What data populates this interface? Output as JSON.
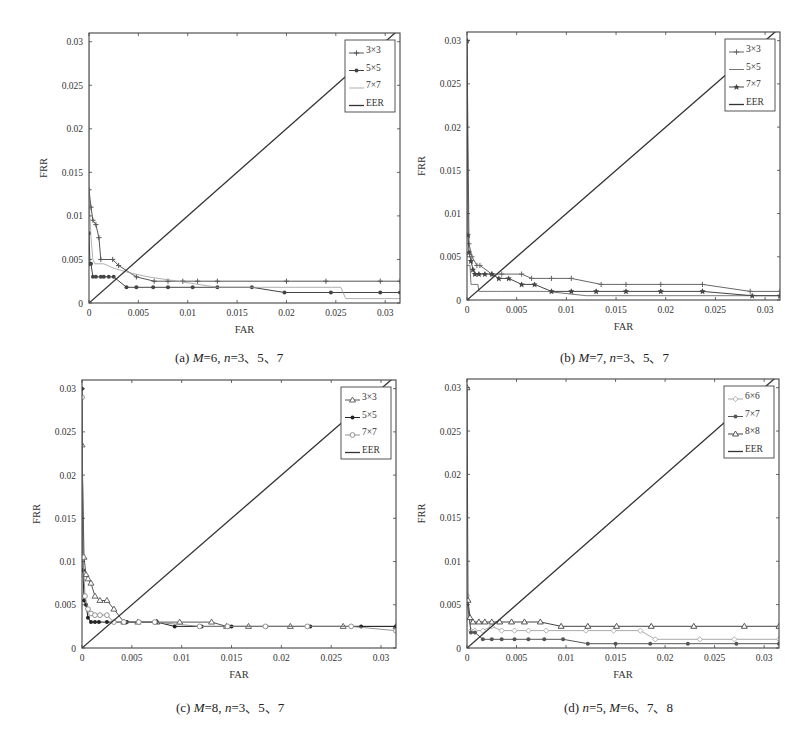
{
  "figure": {
    "captions": [
      {
        "prefix": "(a) ",
        "parts": [
          [
            "M",
            true
          ],
          [
            "=6, ",
            false
          ],
          [
            "n",
            true
          ],
          [
            "=3、5、7",
            false
          ]
        ]
      },
      {
        "prefix": "(b) ",
        "parts": [
          [
            "M",
            true
          ],
          [
            "=7, ",
            false
          ],
          [
            "n",
            true
          ],
          [
            "=3、5、7",
            false
          ]
        ]
      },
      {
        "prefix": "(c) ",
        "parts": [
          [
            "M",
            true
          ],
          [
            "=8, ",
            false
          ],
          [
            "n",
            true
          ],
          [
            "=3、5、7",
            false
          ]
        ]
      },
      {
        "prefix": "(d) ",
        "parts": [
          [
            "n",
            true
          ],
          [
            "=5, ",
            false
          ],
          [
            "M",
            true
          ],
          [
            "=6、7、8",
            false
          ]
        ]
      }
    ]
  },
  "chart_data": [
    {
      "id": "a",
      "type": "line",
      "title": "(a) M=6, n=3、5、7",
      "xlabel": "FAR",
      "ylabel": "FRR",
      "xlim": [
        0,
        0.0315
      ],
      "ylim": [
        0,
        0.031
      ],
      "xticks": [
        0,
        0.005,
        0.01,
        0.015,
        0.02,
        0.025,
        0.03
      ],
      "xtick_labels": [
        "0",
        "0.005",
        "0.01",
        "0.015",
        "0.02",
        "0.025",
        "0.03"
      ],
      "yticks": [
        0,
        0.005,
        0.01,
        0.015,
        0.02,
        0.025,
        0.03
      ],
      "ytick_labels": [
        "0",
        "0.005",
        "0.01",
        "0.015",
        "0.02",
        "0.025",
        "0.03"
      ],
      "grid": false,
      "legend_position": "upper right",
      "series": [
        {
          "name": "3×3",
          "marker": "plus",
          "color": "#555555",
          "width": 1,
          "x": [
            0.0,
            0.0002,
            0.0004,
            0.0007,
            0.001,
            0.0012,
            0.0024,
            0.003,
            0.0048,
            0.0066,
            0.008,
            0.0095,
            0.011,
            0.013,
            0.02,
            0.024,
            0.0295,
            0.0315
          ],
          "y": [
            0.013,
            0.011,
            0.0095,
            0.009,
            0.0075,
            0.005,
            0.005,
            0.0043,
            0.003,
            0.0025,
            0.0025,
            0.0025,
            0.0025,
            0.0025,
            0.0025,
            0.0025,
            0.0025,
            0.0025
          ]
        },
        {
          "name": "5×5",
          "marker": "dot",
          "color": "#444444",
          "width": 1,
          "x": [
            0.0,
            0.0001,
            0.0002,
            0.0004,
            0.0007,
            0.0012,
            0.0015,
            0.002,
            0.0025,
            0.0038,
            0.0048,
            0.0065,
            0.008,
            0.0105,
            0.013,
            0.0165,
            0.0198,
            0.0245,
            0.0295,
            0.0315
          ],
          "y": [
            0.008,
            0.0045,
            0.0045,
            0.003,
            0.003,
            0.003,
            0.003,
            0.003,
            0.003,
            0.0018,
            0.0018,
            0.0018,
            0.0018,
            0.0018,
            0.0018,
            0.0018,
            0.0012,
            0.0012,
            0.0012,
            0.0012
          ]
        },
        {
          "name": "7×7",
          "marker": "none",
          "color": "#9a9a9a",
          "width": 0.8,
          "x": [
            0.0,
            0.0,
            0.0,
            0.0002,
            0.0004,
            0.0006,
            0.0015,
            0.0025,
            0.004,
            0.006,
            0.009,
            0.013,
            0.0165,
            0.0225,
            0.0255,
            0.026,
            0.0315
          ],
          "y": [
            0.03,
            0.02,
            0.012,
            0.0075,
            0.005,
            0.0045,
            0.0045,
            0.004,
            0.0035,
            0.003,
            0.0025,
            0.0018,
            0.0018,
            0.0018,
            0.0018,
            0.0005,
            0.0005
          ]
        },
        {
          "name": "EER",
          "marker": "none",
          "color": "#333333",
          "width": 1.3,
          "x": [
            0,
            0.0315
          ],
          "y": [
            0,
            0.0315
          ]
        }
      ]
    },
    {
      "id": "b",
      "type": "line",
      "title": "(b) M=7, n=3、5、7",
      "xlabel": "FAR",
      "ylabel": "FRR",
      "xlim": [
        0,
        0.0315
      ],
      "ylim": [
        0,
        0.031
      ],
      "xticks": [
        0,
        0.005,
        0.01,
        0.015,
        0.02,
        0.025,
        0.03
      ],
      "xtick_labels": [
        "0",
        "0.005",
        "0.01",
        "0.015",
        "0.02",
        "0.025",
        "0.03"
      ],
      "yticks": [
        0,
        0.005,
        0.01,
        0.015,
        0.02,
        0.025,
        0.03
      ],
      "ytick_labels": [
        "0",
        "0.005",
        "0.01",
        "0.015",
        "0.02",
        "0.025",
        "0.03"
      ],
      "grid": false,
      "legend_position": "upper right",
      "series": [
        {
          "name": "3×3",
          "marker": "plus",
          "color": "#666666",
          "width": 1,
          "x": [
            0.0,
            0.0002,
            0.0005,
            0.001,
            0.0013,
            0.0025,
            0.0035,
            0.0055,
            0.0065,
            0.0085,
            0.0105,
            0.0135,
            0.016,
            0.0195,
            0.0237,
            0.0285,
            0.0315
          ],
          "y": [
            0.03,
            0.0065,
            0.005,
            0.004,
            0.004,
            0.003,
            0.003,
            0.003,
            0.0025,
            0.0025,
            0.0025,
            0.0018,
            0.0018,
            0.0018,
            0.0018,
            0.001,
            0.001
          ]
        },
        {
          "name": "5×5",
          "marker": "none",
          "color": "#777777",
          "width": 1,
          "x": [
            0.0,
            0.0003,
            0.0004,
            0.0011,
            0.0012,
            0.0035,
            0.008,
            0.012,
            0.0315
          ],
          "y": [
            0.004,
            0.004,
            0.0018,
            0.0018,
            0.001,
            0.001,
            0.001,
            0.0005,
            0.0005
          ]
        },
        {
          "name": "7×7",
          "marker": "star",
          "color": "#444444",
          "width": 1,
          "x": [
            0.0,
            0.0001,
            0.0002,
            0.0004,
            0.0006,
            0.0008,
            0.0012,
            0.0018,
            0.0025,
            0.0032,
            0.0042,
            0.0055,
            0.0068,
            0.0085,
            0.0105,
            0.013,
            0.016,
            0.0195,
            0.0237,
            0.0287,
            0.0315
          ],
          "y": [
            0.03,
            0.0075,
            0.0055,
            0.0045,
            0.0035,
            0.003,
            0.003,
            0.003,
            0.003,
            0.0025,
            0.0025,
            0.0018,
            0.0018,
            0.001,
            0.001,
            0.001,
            0.001,
            0.001,
            0.001,
            0.0005,
            0.0005
          ]
        },
        {
          "name": "EER",
          "marker": "none",
          "color": "#333333",
          "width": 1.3,
          "x": [
            0,
            0.0315
          ],
          "y": [
            0,
            0.0315
          ]
        }
      ]
    },
    {
      "id": "c",
      "type": "line",
      "title": "(c) M=8, n=3、5、7",
      "xlabel": "FAR",
      "ylabel": "FRR",
      "xlim": [
        0,
        0.0315
      ],
      "ylim": [
        0,
        0.031
      ],
      "xticks": [
        0,
        0.005,
        0.01,
        0.015,
        0.02,
        0.025,
        0.03
      ],
      "xtick_labels": [
        "0",
        "0.005",
        "0.01",
        "0.015",
        "0.02",
        "0.025",
        "0.03"
      ],
      "yticks": [
        0,
        0.005,
        0.01,
        0.015,
        0.02,
        0.025,
        0.03
      ],
      "ytick_labels": [
        "0",
        "0.005",
        "0.01",
        "0.015",
        "0.02",
        "0.025",
        "0.03"
      ],
      "grid": false,
      "legend_position": "upper right",
      "series": [
        {
          "name": "3×3",
          "marker": "triangle",
          "color": "#555555",
          "width": 1,
          "x": [
            0.0,
            0.0002,
            0.0004,
            0.0006,
            0.0009,
            0.0013,
            0.0018,
            0.0025,
            0.0032,
            0.0042,
            0.0056,
            0.0075,
            0.0098,
            0.013,
            0.0145,
            0.0167,
            0.0209,
            0.0262,
            0.0315
          ],
          "y": [
            0.0235,
            0.0105,
            0.0085,
            0.008,
            0.0075,
            0.006,
            0.0055,
            0.0055,
            0.0045,
            0.003,
            0.003,
            0.003,
            0.003,
            0.003,
            0.0025,
            0.0025,
            0.0025,
            0.0025,
            0.0025
          ]
        },
        {
          "name": "5×5",
          "marker": "dot",
          "color": "#222222",
          "width": 1,
          "x": [
            0.0,
            0.0001,
            0.0002,
            0.0004,
            0.0006,
            0.0009,
            0.0013,
            0.0017,
            0.0025,
            0.0032,
            0.0045,
            0.0057,
            0.0075,
            0.0093,
            0.012,
            0.015,
            0.0185,
            0.0229,
            0.028,
            0.0315
          ],
          "y": [
            0.03,
            0.009,
            0.0055,
            0.005,
            0.0035,
            0.003,
            0.003,
            0.003,
            0.003,
            0.003,
            0.003,
            0.003,
            0.003,
            0.0025,
            0.0025,
            0.0025,
            0.0025,
            0.0025,
            0.0025,
            0.0025
          ]
        },
        {
          "name": "7×7",
          "marker": "circle",
          "color": "#888888",
          "width": 0.9,
          "x": [
            0.0,
            0.0001,
            0.0003,
            0.0006,
            0.0009,
            0.0013,
            0.0018,
            0.0025,
            0.0032,
            0.0042,
            0.0057,
            0.0073,
            0.0118,
            0.0146,
            0.0184,
            0.0226,
            0.027,
            0.0315
          ],
          "y": [
            0.029,
            0.0105,
            0.006,
            0.0045,
            0.004,
            0.0038,
            0.0038,
            0.0038,
            0.003,
            0.003,
            0.003,
            0.003,
            0.0025,
            0.0025,
            0.0025,
            0.0025,
            0.0025,
            0.002
          ]
        },
        {
          "name": "EER",
          "marker": "none",
          "color": "#333333",
          "width": 1.3,
          "x": [
            0,
            0.0315
          ],
          "y": [
            0,
            0.0315
          ]
        }
      ]
    },
    {
      "id": "d",
      "type": "line",
      "title": "(d) n=5, M=6、7、8",
      "xlabel": "FAR",
      "ylabel": "FRR",
      "xlim": [
        0,
        0.0315
      ],
      "ylim": [
        0,
        0.031
      ],
      "xticks": [
        0,
        0.005,
        0.01,
        0.015,
        0.02,
        0.025,
        0.03
      ],
      "xtick_labels": [
        "0",
        "0.005",
        "0.01",
        "0.015",
        "0.02",
        "0.025",
        "0.03"
      ],
      "yticks": [
        0,
        0.005,
        0.01,
        0.015,
        0.02,
        0.025,
        0.03
      ],
      "ytick_labels": [
        "0",
        "0.005",
        "0.01",
        "0.015",
        "0.02",
        "0.025",
        "0.03"
      ],
      "grid": false,
      "legend_position": "upper right",
      "series": [
        {
          "name": "6×6",
          "marker": "diamond",
          "color": "#a0a0a0",
          "width": 0.9,
          "x": [
            0.0,
            0.0004,
            0.0008,
            0.0016,
            0.0025,
            0.0035,
            0.0048,
            0.0062,
            0.008,
            0.012,
            0.0148,
            0.0175,
            0.019,
            0.0235,
            0.027,
            0.0315
          ],
          "y": [
            0.006,
            0.002,
            0.002,
            0.002,
            0.0025,
            0.002,
            0.002,
            0.002,
            0.002,
            0.002,
            0.002,
            0.002,
            0.001,
            0.001,
            0.001,
            0.001
          ]
        },
        {
          "name": "7×7",
          "marker": "dot",
          "color": "#555555",
          "width": 1,
          "x": [
            0.0,
            0.0004,
            0.0008,
            0.0016,
            0.0025,
            0.0035,
            0.0048,
            0.0062,
            0.0078,
            0.0097,
            0.0122,
            0.015,
            0.0185,
            0.0223,
            0.0272,
            0.0315
          ],
          "y": [
            0.0055,
            0.0018,
            0.0018,
            0.001,
            0.001,
            0.001,
            0.001,
            0.001,
            0.001,
            0.001,
            0.0005,
            0.0005,
            0.0005,
            0.0005,
            0.0005,
            0.0005
          ]
        },
        {
          "name": "8×8",
          "marker": "triangle",
          "color": "#444444",
          "width": 1,
          "x": [
            0.0,
            0.0001,
            0.0003,
            0.0006,
            0.0012,
            0.0018,
            0.0025,
            0.0033,
            0.0045,
            0.0058,
            0.0074,
            0.0095,
            0.0122,
            0.0151,
            0.0186,
            0.0229,
            0.028,
            0.0315
          ],
          "y": [
            0.03,
            0.0055,
            0.0035,
            0.003,
            0.003,
            0.003,
            0.003,
            0.003,
            0.003,
            0.003,
            0.003,
            0.0025,
            0.0025,
            0.0025,
            0.0025,
            0.0025,
            0.0025,
            0.0025
          ]
        },
        {
          "name": "EER",
          "marker": "none",
          "color": "#333333",
          "width": 1.3,
          "x": [
            0,
            0.0315
          ],
          "y": [
            0,
            0.0315
          ]
        }
      ]
    }
  ]
}
